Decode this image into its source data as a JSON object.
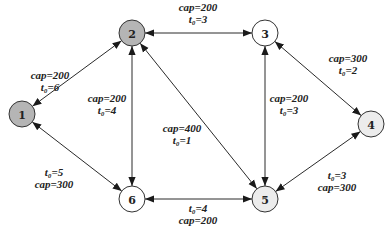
{
  "diagram": {
    "type": "network-graph",
    "nodes": [
      {
        "id": "1",
        "label": "1",
        "fill": "#b5b5b5"
      },
      {
        "id": "2",
        "label": "2",
        "fill": "#b5b5b5"
      },
      {
        "id": "3",
        "label": "3",
        "fill": "#ffffff"
      },
      {
        "id": "4",
        "label": "4",
        "fill": "#ececec"
      },
      {
        "id": "5",
        "label": "5",
        "fill": "#ececec"
      },
      {
        "id": "6",
        "label": "6",
        "fill": "#ffffff"
      }
    ],
    "edges": [
      {
        "from": "1",
        "to": "2",
        "directed": "both",
        "lines": [
          "cap=200",
          "t₀=6"
        ]
      },
      {
        "from": "2",
        "to": "3",
        "directed": "both",
        "lines": [
          "cap=200",
          "t₀=3"
        ]
      },
      {
        "from": "2",
        "to": "6",
        "directed": "both",
        "lines": [
          "cap=200",
          "t₀=4"
        ]
      },
      {
        "from": "2",
        "to": "5",
        "directed": "both",
        "lines": [
          "cap=400",
          "t₀=1"
        ]
      },
      {
        "from": "3",
        "to": "5",
        "directed": "both",
        "lines": [
          "cap=200",
          "t₀=3"
        ]
      },
      {
        "from": "3",
        "to": "4",
        "directed": "both",
        "lines": [
          "cap=300",
          "t₀=2"
        ]
      },
      {
        "from": "1",
        "to": "6",
        "directed": "both",
        "lines": [
          "t₀=5",
          "cap=300"
        ]
      },
      {
        "from": "6",
        "to": "5",
        "directed": "both",
        "lines": [
          "t₀=4",
          "cap=200"
        ]
      },
      {
        "from": "4",
        "to": "5",
        "directed": "both",
        "lines": [
          "t₀=3",
          "cap=300"
        ]
      }
    ]
  }
}
